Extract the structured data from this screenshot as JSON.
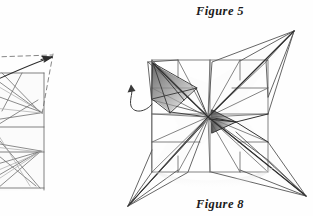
{
  "page": {
    "kind": "scanned-pencil-origami-diagram",
    "background_color": "#fefefe",
    "ink_color": "#3a3a3a",
    "shade_color": "#8d8d8d",
    "width": 313,
    "height": 216
  },
  "labels": {
    "figure5": "Figure 5",
    "figure8": "Figure 8"
  },
  "figures": [
    {
      "id": "figure-5",
      "caption": "Figure 5",
      "caption_position": "top-right",
      "description": "partial origami square crease pattern cropped by the left page edge, with a dashed V-shaped motion guide and a solid arrow pointing up to the right",
      "cropped": true,
      "square": {
        "right_edge_x": 44,
        "top_y": 73,
        "bottom_y": 190
      },
      "arrow": {
        "type": "straight-arrow",
        "from_x": 3,
        "from_y": 79,
        "to_x": 53,
        "to_y": 57
      },
      "dashed_guides": 2
    },
    {
      "id": "figure-8",
      "caption": "Figure 8",
      "caption_position": "bottom-center",
      "description": "four-pointed pinwheel origami base folded from a square, creases radiating to a central hub, one dark shaded corner flap at upper left and a small dark flap at center right",
      "cropped": false,
      "square": {
        "left_x": 152,
        "top_y": 60,
        "right_x": 268,
        "bottom_y": 172
      },
      "center_hub": {
        "x": 208,
        "y": 117
      },
      "star_points": [
        {
          "name": "top-right-point",
          "x": 294,
          "y": 31
        },
        {
          "name": "bottom-right-point",
          "x": 306,
          "y": 196
        },
        {
          "name": "bottom-left-point",
          "x": 128,
          "y": 206
        },
        {
          "name": "top-left-point",
          "x": 148,
          "y": 62
        }
      ],
      "shaded_flaps": [
        {
          "name": "upper-left-cone-flap",
          "tone": "dark"
        },
        {
          "name": "center-right-small-flap",
          "tone": "dark"
        }
      ],
      "curved_arrow": {
        "type": "hook-arrow",
        "direction": "up-left",
        "tip_x": 131,
        "tip_y": 85
      }
    }
  ]
}
